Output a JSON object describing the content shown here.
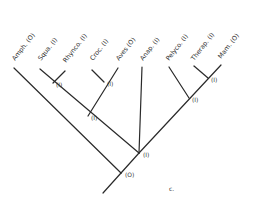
{
  "diagram": {
    "type": "cladogram",
    "panel_label": "c.",
    "line_color": "#2a2a2a",
    "taxa": [
      {
        "id": "amph",
        "label": "Amph. (O)"
      },
      {
        "id": "squa",
        "label": "Squa. (I)"
      },
      {
        "id": "rhynco",
        "label": "Rhynco. (I)"
      },
      {
        "id": "croc",
        "label": "Croc. (I)"
      },
      {
        "id": "aves",
        "label": "Aves (O)"
      },
      {
        "id": "anap",
        "label": "Anap. (I)"
      },
      {
        "id": "pelyco",
        "label": "Pelyco. (I)"
      },
      {
        "id": "therap",
        "label": "Therap. (I)"
      },
      {
        "id": "mam",
        "label": "Mam. (O)"
      }
    ],
    "nodes": [
      {
        "id": "squa_rhynco",
        "label": "(I)",
        "children": [
          "squa",
          "rhynco"
        ]
      },
      {
        "id": "croc_aves",
        "label": "(I)",
        "children": [
          "croc",
          "aves"
        ]
      },
      {
        "id": "diapsid",
        "label": "(I)",
        "children": [
          "squa_rhynco",
          "croc_aves"
        ]
      },
      {
        "id": "therap_mam",
        "label": "(I)",
        "children": [
          "therap",
          "mam"
        ]
      },
      {
        "id": "synapsid",
        "label": "(I)",
        "children": [
          "pelyco",
          "therap_mam"
        ]
      },
      {
        "id": "amniote",
        "label": "(I)",
        "children": [
          "diapsid",
          "anap",
          "synapsid"
        ]
      },
      {
        "id": "root",
        "label": "(O)",
        "children": [
          "amph",
          "amniote"
        ]
      }
    ]
  }
}
